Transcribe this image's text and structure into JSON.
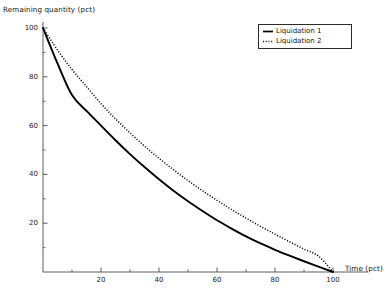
{
  "chart_data": {
    "type": "line",
    "title": "",
    "subtitle": "",
    "xlabel": "Time (pct)",
    "ylabel": "Remaining quantity (pct)",
    "xlim": [
      0,
      100
    ],
    "ylim": [
      0,
      100
    ],
    "xticks": [
      20,
      40,
      60,
      80,
      100
    ],
    "yticks": [
      20,
      40,
      60,
      80,
      100
    ],
    "xtick_labels": [
      "20",
      "40",
      "60",
      "80",
      "100"
    ],
    "ytick_labels": [
      "20",
      "40",
      "60",
      "80",
      "100"
    ],
    "minor_ticks": true,
    "grid": false,
    "legend_position": "top-right",
    "x": [
      0,
      5,
      10,
      15,
      20,
      25,
      30,
      35,
      40,
      45,
      50,
      55,
      60,
      65,
      70,
      75,
      80,
      85,
      90,
      95,
      100
    ],
    "series": [
      {
        "name": "Liquidation 1",
        "style": "solid",
        "color": "#000000",
        "values": [
          100,
          85.5,
          72.5,
          66.0,
          60.0,
          54.0,
          48.3,
          43.0,
          38.0,
          33.3,
          29.0,
          25.0,
          21.2,
          17.8,
          14.6,
          11.7,
          9.1,
          6.7,
          4.4,
          2.2,
          0
        ]
      },
      {
        "name": "Liquidation 2",
        "style": "dotted",
        "color": "#000000",
        "values": [
          100,
          91.0,
          83.0,
          76.0,
          69.0,
          62.8,
          57.0,
          51.6,
          46.6,
          41.9,
          37.5,
          33.3,
          29.4,
          25.6,
          22.1,
          18.7,
          15.5,
          12.4,
          9.4,
          6.5,
          0
        ]
      }
    ]
  },
  "axes": {
    "ylabel": "Remaining quantity (pct)",
    "xlabel": "Time (pct)"
  },
  "legend": {
    "entries": [
      {
        "label": "Liquidation 1",
        "style": "solid"
      },
      {
        "label": "Liquidation 2",
        "style": "dotted"
      }
    ]
  },
  "colors": {
    "axis": "#4a4a4a",
    "series1": "#000000",
    "series2": "#1a1a1a",
    "background": "#ffffff",
    "legend_border": "#2b2b2b"
  }
}
